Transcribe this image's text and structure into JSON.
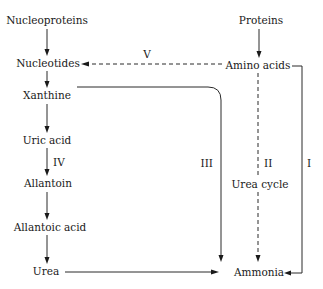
{
  "diagram": {
    "left_chain": [
      {
        "id": "nucleoproteins",
        "label": "Nucleoproteins"
      },
      {
        "id": "nucleotides",
        "label": "Nucleotides"
      },
      {
        "id": "xanthine",
        "label": "Xanthine"
      },
      {
        "id": "uric_acid",
        "label": "Uric acid"
      },
      {
        "id": "allantoin",
        "label": "Allantoin"
      },
      {
        "id": "allantoic_acid",
        "label": "Allantoic acid"
      },
      {
        "id": "urea",
        "label": "Urea"
      }
    ],
    "right_chain": [
      {
        "id": "proteins",
        "label": "Proteins"
      },
      {
        "id": "amino_acids",
        "label": "Amino acids"
      },
      {
        "id": "ammonia",
        "label": "Ammonia"
      }
    ],
    "pathways": {
      "I": {
        "label": "I",
        "from": "Amino acids",
        "to": "Ammonia",
        "style": "solid"
      },
      "II": {
        "label": "II",
        "from": "Amino acids",
        "to": "Ammonia",
        "style": "dashed",
        "note": "Urea cycle"
      },
      "III": {
        "label": "III",
        "from": "Xanthine",
        "to": "Ammonia",
        "style": "solid"
      },
      "IV": {
        "label": "IV",
        "from": "Uric acid",
        "to": "Allantoin",
        "style": "solid"
      },
      "V": {
        "label": "V",
        "from": "Amino acids",
        "to": "Nucleotides",
        "style": "dashed"
      }
    },
    "urea_to_ammonia": {
      "from": "Urea",
      "to": "Ammonia",
      "style": "solid"
    }
  }
}
